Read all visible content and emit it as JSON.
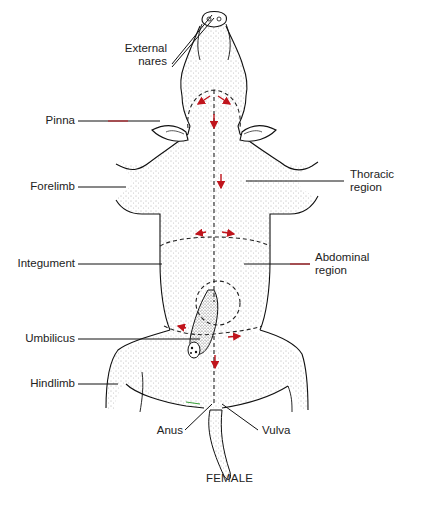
{
  "figure": {
    "caption": "FEMALE",
    "colors": {
      "outline": "#111111",
      "stipple": "#555555",
      "incision_line": "#222222",
      "arrow": "#c0141c",
      "accent_green": "#3aa03a"
    }
  },
  "labels": {
    "external_nares": {
      "line1": "External",
      "line2": "nares"
    },
    "pinna": "Pinna",
    "forelimb": "Forelimb",
    "integument": "Integument",
    "umbilicus": "Umbilicus",
    "hindlimb": "Hindlimb",
    "anus": "Anus",
    "vulva": "Vulva",
    "thoracic_region": {
      "line1": "Thoracic",
      "line2": "region"
    },
    "abdominal_region": {
      "line1": "Abdominal",
      "line2": "region"
    }
  },
  "incision_arrows": [
    {
      "location": "jaw",
      "directions": [
        "down-left",
        "down-right"
      ]
    },
    {
      "location": "neck-midline",
      "direction": "down"
    },
    {
      "location": "chest-midline",
      "direction": "down"
    },
    {
      "location": "rib-cut",
      "directions": [
        "left",
        "right"
      ]
    },
    {
      "location": "umbilical-cut",
      "directions": [
        "left",
        "right"
      ]
    },
    {
      "location": "lower-midline",
      "direction": "down"
    }
  ]
}
